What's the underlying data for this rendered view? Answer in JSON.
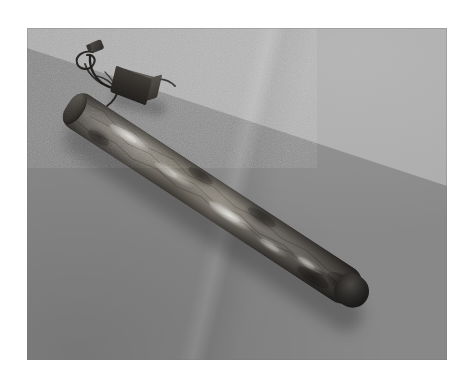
{
  "scene": {
    "kind": "photograph",
    "subject": "elongated-dark-object-on-grey-surface",
    "caption": "",
    "colors": {
      "page_background": "#ffffff",
      "print_border": "#ffffff",
      "surface_back_light_grey": "#ababab",
      "surface_front_dark_grey": "#888888",
      "object_mid_tone": "#6e6a64",
      "object_highlight": "#e6e6e0",
      "object_shadow": "#1a1918",
      "device_box_dark": "#2b2825",
      "wire_black": "#1c1a19"
    },
    "print": {
      "left": 27,
      "top": 28,
      "width": 420,
      "height": 332
    },
    "horizon": {
      "description": "diagonal edge between lighter back wall and darker floor",
      "left_y": 48,
      "right_y": 186
    },
    "objects": [
      {
        "name": "long-object",
        "label": "elongated dark mottled object",
        "start": [
          72,
          93
        ],
        "end": [
          398,
          326
        ],
        "angle_deg": 33.2
      },
      {
        "name": "device-box",
        "label": "small dark rectangular box",
        "bounds": [
          112,
          68,
          38,
          32
        ]
      },
      {
        "name": "plug-connector",
        "label": "small dark plug connector",
        "bounds": [
          88,
          40,
          14,
          12
        ]
      },
      {
        "name": "wires",
        "label": "thin black looping wires"
      }
    ]
  }
}
